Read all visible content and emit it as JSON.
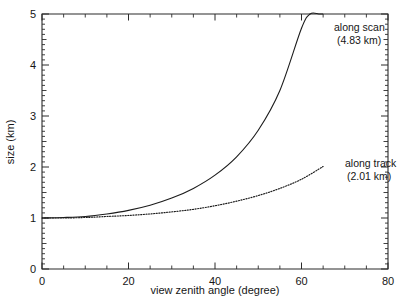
{
  "chart_data": {
    "type": "line",
    "title": "",
    "xlabel": "view zenith angle (degree)",
    "ylabel": "size (km)",
    "xlim": [
      0,
      80
    ],
    "ylim": [
      0,
      5
    ],
    "xticks": [
      0,
      20,
      40,
      60,
      80
    ],
    "xticklabels": [
      "0",
      "20",
      "40",
      "60",
      "80"
    ],
    "yticks": [
      0,
      1,
      2,
      3,
      4,
      5
    ],
    "yticklabels": [
      "0",
      "1",
      "2",
      "3",
      "4",
      "5"
    ],
    "x_minor_step": 5,
    "y_minor_step": 0.1,
    "grid": false,
    "legend_position": "inline-annotation",
    "series": [
      {
        "name": "along scan",
        "nadir_size_km": 4.83,
        "annotation_line1": "along scan",
        "annotation_line2": "(4.83 km)",
        "style": "solid",
        "color": "#1c1c1c",
        "x": [
          0,
          5,
          10,
          15,
          20,
          25,
          30,
          35,
          40,
          45,
          50,
          55,
          60,
          62,
          64,
          65
        ],
        "values": [
          1.0,
          1.01,
          1.03,
          1.08,
          1.15,
          1.25,
          1.39,
          1.58,
          1.84,
          2.2,
          2.72,
          3.5,
          4.72,
          5.0,
          5.0,
          5.0
        ]
      },
      {
        "name": "along track",
        "nadir_size_km": 2.01,
        "annotation_line1": "along track",
        "annotation_line2": "(2.01 km)",
        "style": "dotted",
        "color": "#1c1c1c",
        "x": [
          0,
          5,
          10,
          15,
          20,
          25,
          30,
          35,
          40,
          45,
          50,
          55,
          60,
          65
        ],
        "values": [
          1.0,
          1.0,
          1.01,
          1.03,
          1.05,
          1.08,
          1.12,
          1.17,
          1.24,
          1.33,
          1.44,
          1.58,
          1.76,
          2.01
        ]
      }
    ],
    "annotations": [
      {
        "text": "along scan",
        "x_px": 334,
        "y_px": 31
      },
      {
        "text": "(4.83 km)",
        "x_px": 337,
        "y_px": 44
      },
      {
        "text": "along track",
        "x_px": 345,
        "y_px": 167
      },
      {
        "text": "(2.01 km)",
        "x_px": 347,
        "y_px": 180
      }
    ]
  }
}
